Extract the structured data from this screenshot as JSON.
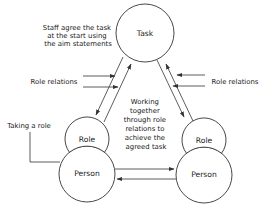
{
  "diagram": {
    "nodes": {
      "task": {
        "label": "Task"
      },
      "role_left": {
        "label": "Role"
      },
      "person_left": {
        "label": "Person"
      },
      "role_right": {
        "label": "Role"
      },
      "person_right": {
        "label": "Person"
      }
    },
    "annotations": {
      "staff_agree": {
        "lines": [
          "Staff agree the task",
          "at the start using",
          "the aim statements"
        ]
      },
      "role_relations_left": {
        "label": "Role relations"
      },
      "role_relations_right": {
        "label": "Role relations"
      },
      "taking_a_role": {
        "label": "Taking a role"
      },
      "working_together": {
        "lines": [
          "Working",
          "together",
          "through role",
          "relations to",
          "achieve the",
          "agreed task"
        ]
      }
    },
    "edges": [
      {
        "from": "task",
        "to": "role_left",
        "direction": "to"
      },
      {
        "from": "role_left",
        "to": "task",
        "direction": "to"
      },
      {
        "from": "task",
        "to": "role_right",
        "direction": "to"
      },
      {
        "from": "role_right",
        "to": "task",
        "direction": "to"
      },
      {
        "from": "person_left",
        "to": "person_right",
        "direction": "to"
      },
      {
        "from": "person_right",
        "to": "person_left",
        "direction": "to"
      },
      {
        "from": "role_relations_left",
        "to": "left-links",
        "direction": "to",
        "count": 2
      },
      {
        "from": "role_relations_right",
        "to": "right-links",
        "direction": "to",
        "count": 2
      },
      {
        "from": "taking_a_role",
        "to": "person_left",
        "direction": "none"
      }
    ],
    "colors": {
      "stroke": "#333333",
      "text": "#1a1a1a",
      "background": "#ffffff"
    }
  }
}
